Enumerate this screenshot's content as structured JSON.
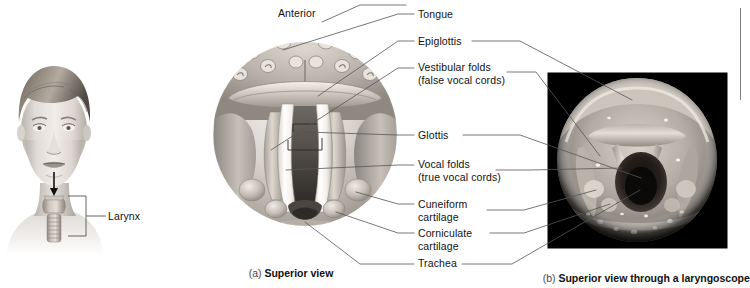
{
  "figure": {
    "orientation_label": "Anterior",
    "panels": [
      {
        "id": "a",
        "index_label": "(a)",
        "caption": "Superior view",
        "type": "illustration"
      },
      {
        "id": "b",
        "index_label": "(b)",
        "caption": "Superior view through a laryngoscope",
        "type": "photograph"
      }
    ],
    "locator": {
      "label": "Larynx",
      "description": "head and neck orientation drawing with arrow to larynx"
    },
    "labels": [
      {
        "id": "tongue",
        "text": "Tongue",
        "line1": "Tongue",
        "line2": "",
        "y": 14,
        "leader_left": true,
        "leader_right": false
      },
      {
        "id": "epiglottis",
        "text": "Epiglottis",
        "line1": "Epiglottis",
        "line2": "",
        "y": 41,
        "leader_left": true,
        "leader_right": true
      },
      {
        "id": "vestibular-folds",
        "text": "Vestibular folds (false vocal cords)",
        "line1": "Vestibular folds",
        "line2": "(false vocal cords)",
        "y": 67,
        "leader_left": true,
        "leader_right": true
      },
      {
        "id": "glottis",
        "text": "Glottis",
        "line1": "Glottis",
        "line2": "",
        "y": 135,
        "leader_left": true,
        "leader_right": true
      },
      {
        "id": "vocal-folds",
        "text": "Vocal folds (true vocal cords)",
        "line1": "Vocal folds",
        "line2": "(true vocal cords)",
        "y": 164,
        "leader_left": true,
        "leader_right": true
      },
      {
        "id": "cuneiform-cartilage",
        "text": "Cuneiform cartilage",
        "line1": "Cuneiform",
        "line2": "cartilage",
        "y": 204,
        "leader_left": true,
        "leader_right": true
      },
      {
        "id": "corniculate-cartilage",
        "text": "Corniculate cartilage",
        "line1": "Corniculate",
        "line2": "cartilage",
        "y": 233,
        "leader_left": true,
        "leader_right": true
      },
      {
        "id": "trachea",
        "text": "Trachea",
        "line1": "Trachea",
        "line2": "",
        "y": 263,
        "leader_left": true,
        "leader_right": true
      }
    ],
    "colors": {
      "leader_line": "#555555",
      "text": "#111111",
      "photo_background": "#000000",
      "page_background": "#ffffff",
      "rule": "#808080"
    }
  }
}
